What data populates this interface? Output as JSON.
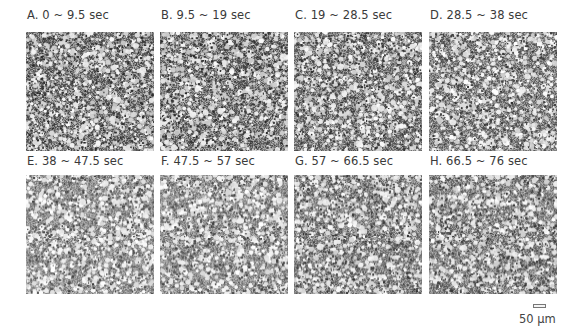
{
  "figure": {
    "panels": [
      {
        "id": "A",
        "label": "A. 0 ~ 9.5 sec"
      },
      {
        "id": "B",
        "label": "B. 9.5 ~ 19 sec"
      },
      {
        "id": "C",
        "label": "C. 19 ~ 28.5 sec"
      },
      {
        "id": "D",
        "label": "D. 28.5 ~ 38 sec"
      },
      {
        "id": "E",
        "label": "E. 38 ~ 47.5 sec"
      },
      {
        "id": "F",
        "label": "F. 47.5 ~ 57 sec"
      },
      {
        "id": "G",
        "label": "G. 57 ~ 66.5 sec"
      },
      {
        "id": "H",
        "label": "H. 66.5 ~ 76 sec"
      }
    ],
    "scale_bar": {
      "label": "50 μm"
    }
  }
}
